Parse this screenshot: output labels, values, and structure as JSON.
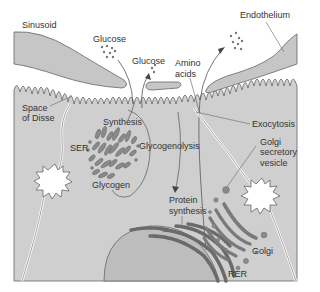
{
  "diagram": {
    "colors": {
      "cytoplasm": "#cfcfcf",
      "endothelium": "#c6c6c6",
      "nucleus": "#bdbdbd",
      "organelle": "#707070",
      "outline": "#555555",
      "text": "#333333",
      "background": "#ffffff"
    },
    "labels": {
      "sinusoid": "Sinusoid",
      "endothelium": "Endothelium",
      "glucose_1": "Glucose",
      "glucose_2": "Glucose",
      "amino_acids_1": "Amino",
      "amino_acids_2": "acids",
      "space_of_disse_1": "Space",
      "space_of_disse_2": "of Disse",
      "synthesis": "Synthesis",
      "ser": "SER",
      "glycogenolysis": "Glycogenolysis",
      "glycogen": "Glycogen",
      "exocytosis": "Exocytosis",
      "golgi_secretory_1": "Golgi",
      "golgi_secretory_2": "secretory",
      "golgi_secretory_3": "vesicle",
      "protein_synthesis_1": "Protein",
      "protein_synthesis_2": "synthesis",
      "golgi": "Golgi",
      "rer": "RER"
    }
  }
}
